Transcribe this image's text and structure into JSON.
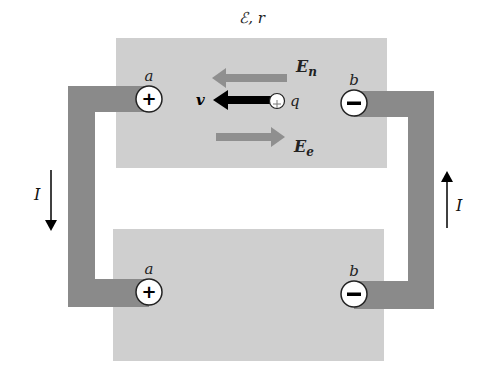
{
  "title_label": "ℰ, r",
  "colors": {
    "box": "#cfcfcf",
    "wire": "#8a8a8a",
    "field_arrow": "#8f8f8f",
    "velocity_arrow": "#000000",
    "terminal_fill": "#ffffff",
    "background": "#ffffff"
  },
  "top_source": {
    "terminal_a": {
      "label": "a",
      "sign": "+"
    },
    "terminal_b": {
      "label": "b",
      "sign": "−"
    },
    "field_n": {
      "label": "E",
      "subscript": "n",
      "direction": "left"
    },
    "field_e": {
      "label": "E",
      "subscript": "e",
      "direction": "right"
    },
    "velocity": {
      "label": "v",
      "direction": "left"
    },
    "charge": {
      "label": "q",
      "sign": "+"
    }
  },
  "bottom_source": {
    "terminal_a": {
      "label": "a",
      "sign": "+"
    },
    "terminal_b": {
      "label": "b",
      "sign": "−"
    }
  },
  "current_left": {
    "label": "I",
    "direction": "down"
  },
  "current_right": {
    "label": "I",
    "direction": "up"
  }
}
